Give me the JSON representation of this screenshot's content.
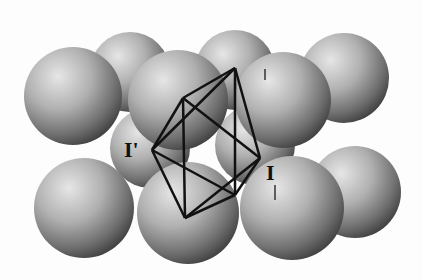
{
  "figure": {
    "labels": {
      "left": "I'",
      "right": "I"
    }
  }
}
